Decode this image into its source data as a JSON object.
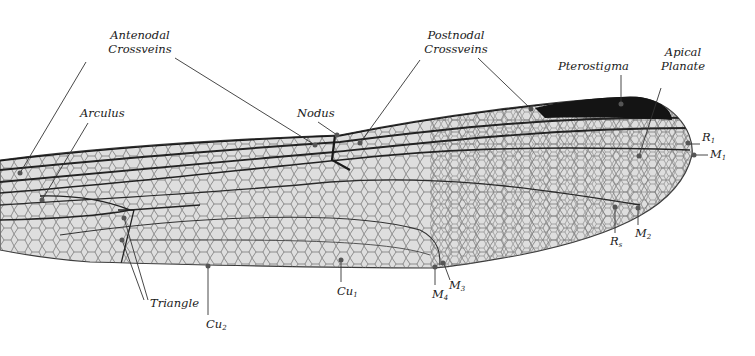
{
  "diagram": {
    "labels": {
      "antenodal": {
        "line1": "Antenodal",
        "line2": "Crossveins"
      },
      "postnodal": {
        "line1": "Postnodal",
        "line2": "Crossveins"
      },
      "pterostigma": "Pterostigma",
      "apical_planate": {
        "line1": "Apical",
        "line2": "Planate"
      },
      "arculus": "Arculus",
      "nodus": "Nodus",
      "triangle": "Triangle",
      "r1": {
        "base": "R",
        "sub": "1"
      },
      "m1": {
        "base": "M",
        "sub": "1"
      },
      "rs": {
        "base": "R",
        "sub": "s"
      },
      "m2": {
        "base": "M",
        "sub": "2"
      },
      "m3": {
        "base": "M",
        "sub": "3"
      },
      "m4": {
        "base": "M",
        "sub": "4"
      },
      "cu1": {
        "base": "Cu",
        "sub": "1"
      },
      "cu2": {
        "base": "Cu",
        "sub": "2"
      }
    },
    "colors": {
      "wing_fill": "#dcdcdc",
      "vein": "#2b2b2b",
      "pterostigma": "#151515",
      "pointer_dot": "#555555",
      "leader_line": "#333333"
    }
  }
}
